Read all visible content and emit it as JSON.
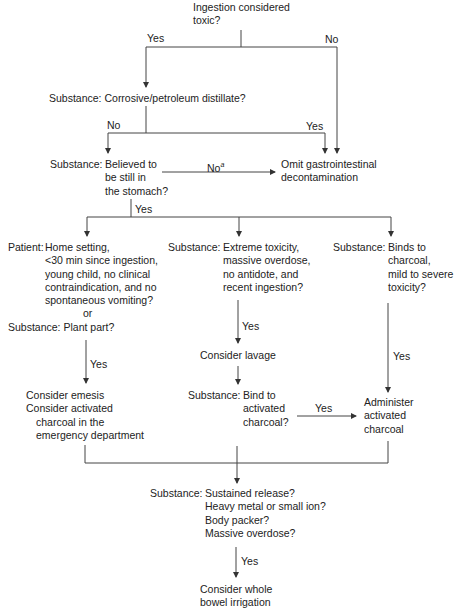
{
  "nodes": {
    "toxic": {
      "lines": [
        "Ingestion considered",
        "toxic?"
      ]
    },
    "corrosive": {
      "text": "Substance: Corrosive/petroleum distillate?"
    },
    "stomach": {
      "prefix": "Substance:",
      "lines": [
        "Believed to",
        "be still in",
        "the stomach?"
      ]
    },
    "omit": {
      "lines": [
        "Omit gastrointestinal",
        "decontamination"
      ]
    },
    "patient": {
      "prefix": "Patient:",
      "lines": [
        "Home setting,",
        "<30 min since ingestion,",
        "young child, no clinical",
        "contraindication, and no",
        "spontaneous vomiting?"
      ],
      "or": "or",
      "plant": "Substance: Plant part?"
    },
    "extreme": {
      "prefix": "Substance:",
      "lines": [
        "Extreme toxicity,",
        "massive overdose,",
        "no antidote, and",
        "recent ingestion?"
      ]
    },
    "binds": {
      "prefix": "Substance:",
      "lines": [
        "Binds to",
        "charcoal,",
        "mild to severe",
        "toxicity?"
      ]
    },
    "lavage": {
      "text": "Consider lavage"
    },
    "emesis": {
      "lines": [
        "Consider emesis",
        "Consider activated",
        "charcoal in the",
        "emergency department"
      ]
    },
    "bind_ac": {
      "prefix": "Substance:",
      "lines": [
        "Bind to",
        "activated",
        "charcoal?"
      ]
    },
    "administer": {
      "lines": [
        "Administer",
        "activated",
        "charcoal"
      ]
    },
    "sustained": {
      "prefix": "Substance:",
      "lines": [
        "Sustained release?",
        "Heavy metal or small ion?",
        "Body packer?",
        "Massive overdose?"
      ]
    },
    "wbi": {
      "lines": [
        "Consider whole",
        "bowel irrigation"
      ]
    }
  },
  "edge_labels": {
    "toxic_yes": "Yes",
    "toxic_no": "No",
    "corrosive_no": "No",
    "corrosive_yes": "Yes",
    "stomach_no": "No",
    "stomach_no_sup": "a",
    "stomach_yes": "Yes",
    "extreme_yes": "Yes",
    "patient_yes": "Yes",
    "binds_yes": "Yes",
    "bind_ac_yes": "Yes",
    "sustained_yes": "Yes"
  }
}
